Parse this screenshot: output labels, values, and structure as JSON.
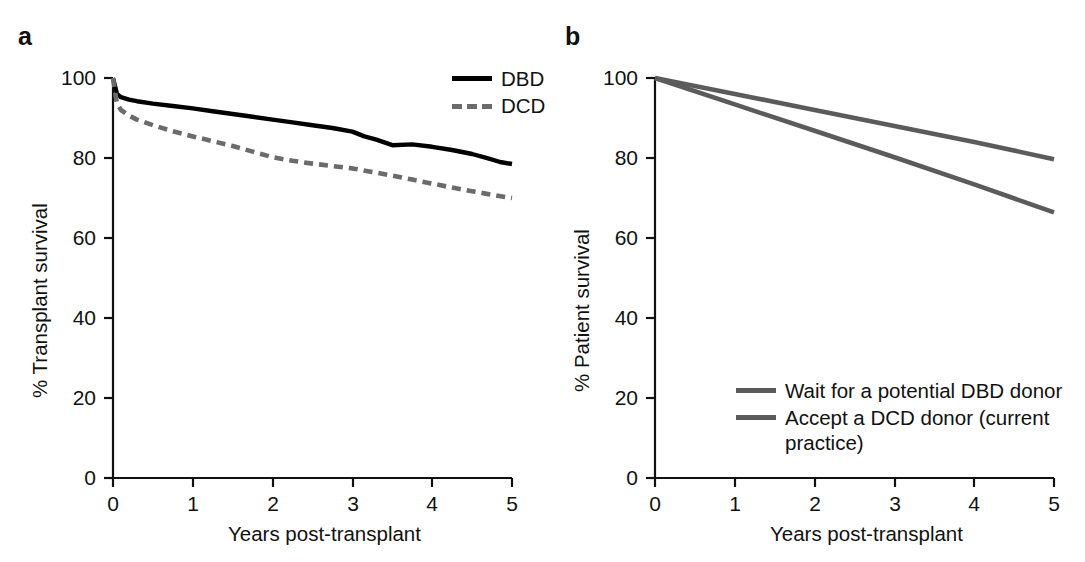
{
  "figure": {
    "background": "#ffffff",
    "panels": [
      {
        "letter": "a",
        "xlabel": "Years post-transplant",
        "ylabel": "% Transplant survival"
      },
      {
        "letter": "b",
        "xlabel": "Years post-transplant",
        "ylabel": "% Patient survival"
      }
    ]
  },
  "chart_data": [
    {
      "id": "panel-a",
      "type": "line",
      "title": "",
      "xlabel": "Years post-transplant",
      "ylabel": "% Transplant survival",
      "xlim": [
        0,
        5
      ],
      "ylim": [
        0,
        100
      ],
      "xticks": [
        "0",
        "1",
        "2",
        "3",
        "4",
        "5"
      ],
      "yticks": [
        "0",
        "20",
        "40",
        "60",
        "80",
        "100"
      ],
      "grid": false,
      "legend_position": "top-right",
      "series": [
        {
          "name": "DBD",
          "color": "#000000",
          "style": "solid",
          "x": [
            0,
            0.05,
            0.1,
            0.2,
            0.3,
            0.5,
            0.75,
            1.0,
            1.25,
            1.5,
            1.75,
            2.0,
            2.25,
            2.5,
            2.75,
            3.0,
            3.15,
            3.3,
            3.5,
            3.75,
            4.0,
            4.25,
            4.5,
            4.7,
            4.85,
            5.0
          ],
          "y": [
            100,
            96.0,
            95.2,
            94.6,
            94.2,
            93.6,
            93.0,
            92.4,
            91.7,
            91.0,
            90.3,
            89.6,
            88.9,
            88.2,
            87.5,
            86.6,
            85.4,
            84.6,
            83.2,
            83.4,
            82.8,
            82.0,
            81.0,
            79.9,
            79.0,
            78.5
          ]
        },
        {
          "name": "DCD",
          "color": "#6b6b6b",
          "style": "dashed",
          "x": [
            0,
            0.05,
            0.1,
            0.2,
            0.3,
            0.5,
            0.75,
            1.0,
            1.25,
            1.5,
            1.75,
            2.0,
            2.25,
            2.5,
            2.75,
            3.0,
            3.25,
            3.5,
            3.75,
            4.0,
            4.25,
            4.5,
            4.75,
            5.0
          ],
          "y": [
            100,
            93.5,
            92.0,
            90.6,
            89.6,
            88.2,
            86.7,
            85.4,
            84.2,
            83.0,
            81.6,
            80.2,
            79.3,
            78.6,
            78.0,
            77.4,
            76.5,
            75.6,
            74.6,
            73.6,
            72.6,
            71.7,
            70.8,
            70.0
          ]
        }
      ],
      "legend": [
        {
          "label": "DBD",
          "color": "#000000",
          "style": "solid"
        },
        {
          "label": "DCD",
          "color": "#6b6b6b",
          "style": "dashed"
        }
      ]
    },
    {
      "id": "panel-b",
      "type": "line",
      "title": "",
      "xlabel": "Years post-transplant",
      "ylabel": "% Patient survival",
      "xlim": [
        0,
        5
      ],
      "ylim": [
        0,
        100
      ],
      "xticks": [
        "0",
        "1",
        "2",
        "3",
        "4",
        "5"
      ],
      "yticks": [
        "0",
        "20",
        "40",
        "60",
        "80",
        "100"
      ],
      "grid": false,
      "legend_position": "bottom-right",
      "series": [
        {
          "name": "Wait for a potential DBD donor",
          "color": "#5b5b5b",
          "style": "solid",
          "x": [
            0,
            1,
            2,
            3,
            4,
            5
          ],
          "y": [
            100,
            93.4,
            86.8,
            80.2,
            73.4,
            66.4
          ]
        },
        {
          "name": "Accept a DCD donor (current practice)",
          "color": "#5b5b5b",
          "style": "solid",
          "x": [
            0,
            1,
            2,
            3,
            4,
            5
          ],
          "y": [
            100,
            96.0,
            92.0,
            88.0,
            84.0,
            79.7
          ]
        }
      ],
      "legend": [
        {
          "label": "Wait for a potential DBD donor",
          "color": "#5b5b5b",
          "style": "solid"
        },
        {
          "label": "Accept a DCD donor (current\npractice)",
          "color": "#5b5b5b",
          "style": "solid"
        }
      ]
    }
  ]
}
